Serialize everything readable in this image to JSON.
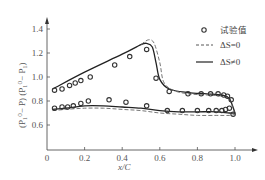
{
  "chart_data": {
    "type": "line",
    "title": "",
    "xlabel": "x/C",
    "ylabel": "(P_t^0 - P) (P_t^0 - P_t)",
    "xlim": [
      0,
      1.1
    ],
    "ylim": [
      0.4,
      1.45
    ],
    "x_ticks": [
      "0",
      "0.2",
      "0.4",
      "0.6",
      "0.8",
      "1.0"
    ],
    "y_ticks": [
      "0.6",
      "0.8",
      "1.0",
      "1.2",
      "1.4"
    ],
    "y_origin_label": "0",
    "grid": false,
    "legend_position": "upper right",
    "legend": [
      {
        "marker": "circle",
        "label": "试验值"
      },
      {
        "style": "dashed",
        "label": "ΔS=0"
      },
      {
        "style": "solid",
        "label": "ΔS≠0"
      }
    ],
    "series": [
      {
        "name": "试验值 (upper surface)",
        "kind": "scatter",
        "x": [
          0.04,
          0.08,
          0.12,
          0.15,
          0.18,
          0.23,
          0.36,
          0.44,
          0.53,
          0.58,
          0.65,
          0.75,
          0.82,
          0.87,
          0.91,
          0.94,
          0.96,
          0.98
        ],
        "y": [
          0.89,
          0.9,
          0.93,
          0.95,
          0.97,
          1.0,
          1.1,
          1.17,
          1.23,
          0.99,
          0.88,
          0.86,
          0.86,
          0.86,
          0.86,
          0.85,
          0.84,
          0.81
        ]
      },
      {
        "name": "试验值 (lower surface)",
        "kind": "scatter",
        "x": [
          0.04,
          0.08,
          0.11,
          0.14,
          0.18,
          0.22,
          0.33,
          0.42,
          0.53,
          0.64,
          0.72,
          0.8,
          0.86,
          0.9,
          0.93,
          0.95,
          0.97,
          0.99
        ],
        "y": [
          0.74,
          0.75,
          0.75,
          0.76,
          0.78,
          0.8,
          0.81,
          0.79,
          0.76,
          0.72,
          0.72,
          0.72,
          0.72,
          0.72,
          0.72,
          0.73,
          0.74,
          0.69
        ]
      },
      {
        "name": "ΔS≠0 (upper)",
        "kind": "solid",
        "x": [
          0.03,
          0.2,
          0.4,
          0.5,
          0.53,
          0.56,
          0.58,
          0.6,
          0.65,
          0.75,
          0.85,
          0.93,
          0.97,
          1.0
        ],
        "y": [
          0.9,
          1.04,
          1.19,
          1.27,
          1.28,
          1.25,
          1.12,
          0.98,
          0.9,
          0.87,
          0.86,
          0.85,
          0.82,
          0.7
        ]
      },
      {
        "name": "ΔS=0 (upper)",
        "kind": "dashed",
        "x": [
          0.5,
          0.54,
          0.57,
          0.6,
          0.62,
          0.67,
          0.75,
          0.85,
          0.93,
          0.97,
          1.0
        ],
        "y": [
          1.27,
          1.31,
          1.28,
          1.12,
          0.96,
          0.89,
          0.86,
          0.85,
          0.84,
          0.81,
          0.69
        ]
      },
      {
        "name": "ΔS≠0 (lower)",
        "kind": "solid",
        "x": [
          0.03,
          0.1,
          0.2,
          0.3,
          0.4,
          0.5,
          0.6,
          0.7,
          0.8,
          0.9,
          0.97,
          1.0
        ],
        "y": [
          0.73,
          0.74,
          0.76,
          0.76,
          0.75,
          0.74,
          0.72,
          0.71,
          0.71,
          0.71,
          0.7,
          0.7
        ]
      },
      {
        "name": "ΔS=0 (lower)",
        "kind": "dashed",
        "x": [
          0.03,
          0.1,
          0.2,
          0.3,
          0.4,
          0.5,
          0.6,
          0.7,
          0.8,
          0.9,
          0.97,
          1.0
        ],
        "y": [
          0.72,
          0.73,
          0.74,
          0.74,
          0.73,
          0.72,
          0.7,
          0.69,
          0.68,
          0.68,
          0.68,
          0.69
        ]
      }
    ]
  },
  "labels": {
    "legend_points": "试验值",
    "legend_dashed": "ΔS=0",
    "legend_solid": "ΔS≠0",
    "xlabel": "x/C",
    "y_origin": "0",
    "ylabel_part1": "(P",
    "ylabel_full": "(P₁⁰− P)  (P₁⁰− P₁)"
  }
}
